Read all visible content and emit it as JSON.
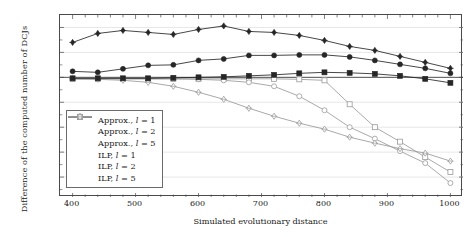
{
  "chart_data": {
    "type": "line",
    "title": "",
    "xlabel": "Simulated evolutionary distance",
    "ylabel": "Difference of the computed number of DCJs",
    "xlim": [
      380,
      1020
    ],
    "ylim": [
      -240,
      125
    ],
    "xticks": [
      400,
      500,
      600,
      700,
      800,
      900,
      1000
    ],
    "yticks": [
      100,
      50,
      0,
      -50,
      -100,
      -150,
      -200
    ],
    "grid": true,
    "legend_position": "lower-left-inside",
    "x": [
      400,
      440,
      480,
      520,
      560,
      600,
      640,
      680,
      720,
      760,
      800,
      840,
      880,
      920,
      960,
      1000
    ],
    "series": [
      {
        "name": "Approx., l = 1",
        "label_prefix": "Approx.,",
        "label_param": "l",
        "label_value": "1",
        "marker": "filled-square",
        "color": "#262626",
        "values": [
          -2,
          -2,
          -2,
          -2,
          -1,
          0,
          1,
          3,
          5,
          8,
          10,
          9,
          7,
          3,
          -3,
          -11
        ]
      },
      {
        "name": "Approx., l = 2",
        "label_prefix": "Approx.,",
        "label_param": "l",
        "label_value": "2",
        "marker": "filled-circle",
        "color": "#262626",
        "values": [
          12,
          10,
          17,
          24,
          25,
          34,
          37,
          44,
          44,
          45,
          45,
          41,
          34,
          26,
          18,
          8
        ]
      },
      {
        "name": "Approx., l = 5",
        "label_prefix": "Approx.,",
        "label_param": "l",
        "label_value": "5",
        "marker": "filled-diamond",
        "color": "#262626",
        "values": [
          70,
          88,
          94,
          90,
          86,
          96,
          103,
          92,
          90,
          84,
          74,
          62,
          54,
          42,
          30,
          18
        ]
      },
      {
        "name": "ILP, l = 1",
        "label_prefix": "ILP,",
        "label_param": "l",
        "label_value": "1",
        "marker": "open-square",
        "color": "#9a9a9a",
        "values": [
          -3,
          -3,
          -3,
          -3,
          -3,
          -3,
          -3,
          -3,
          -3,
          -4,
          -6,
          -54,
          -100,
          -129,
          -160,
          -190
        ]
      },
      {
        "name": "ILP, l = 2",
        "label_prefix": "ILP,",
        "label_param": "l",
        "label_value": "2",
        "marker": "open-circle",
        "color": "#9a9a9a",
        "values": [
          -3,
          -3,
          -3,
          -3,
          -3,
          -4,
          -6,
          -10,
          -18,
          -38,
          -66,
          -100,
          -123,
          -148,
          -172,
          -212
        ]
      },
      {
        "name": "ILP, l = 5",
        "label_prefix": "ILP,",
        "label_param": "l",
        "label_value": "5",
        "marker": "open-diamond",
        "color": "#9a9a9a",
        "values": [
          -3,
          -4,
          -6,
          -10,
          -18,
          -30,
          -44,
          -62,
          -78,
          -92,
          -104,
          -120,
          -132,
          -143,
          -152,
          -168
        ]
      }
    ]
  }
}
